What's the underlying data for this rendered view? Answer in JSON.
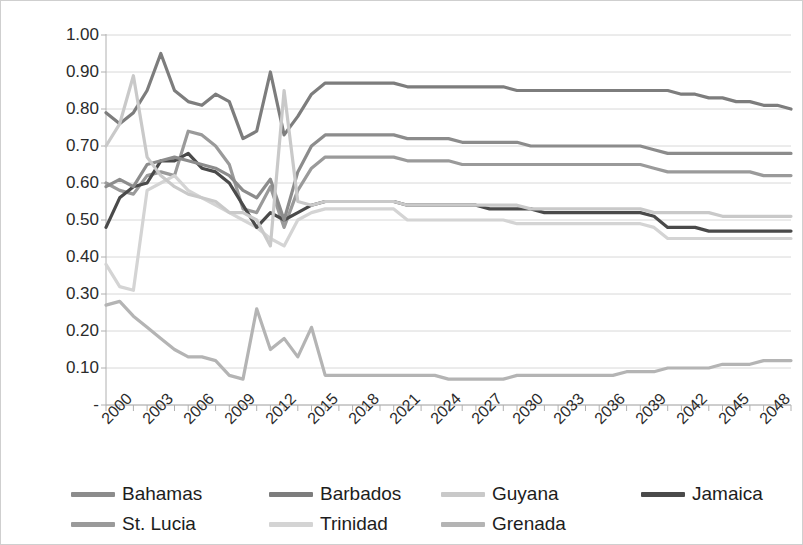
{
  "axes": {
    "ylabel": "Index",
    "yticks": [
      "1.00",
      "0.90",
      "0.80",
      "0.70",
      "0.60",
      "0.50",
      "0.40",
      "0.30",
      "0.20",
      "0.10",
      "-"
    ],
    "xticks": [
      "2000",
      "2003",
      "2006",
      "2009",
      "2012",
      "2015",
      "2018",
      "2021",
      "2024",
      "2027",
      "2030",
      "2033",
      "2036",
      "2039",
      "2042",
      "2045",
      "2048"
    ]
  },
  "legend": {
    "items": [
      {
        "label": "Bahamas",
        "color": "#8c8c8c"
      },
      {
        "label": "Barbados",
        "color": "#7d7d7d"
      },
      {
        "label": "Guyana",
        "color": "#c9c9c9"
      },
      {
        "label": "Jamaica",
        "color": "#4a4a4a"
      },
      {
        "label": "St. Lucia",
        "color": "#9a9a9a"
      },
      {
        "label": "Trinidad",
        "color": "#d4d4d4"
      },
      {
        "label": "Grenada",
        "color": "#b4b4b4"
      }
    ]
  },
  "chart_data": {
    "type": "line",
    "title": "",
    "xlabel": "",
    "ylabel": "Index",
    "xlim": [
      2000,
      2050
    ],
    "ylim": [
      0,
      1.0
    ],
    "grid": true,
    "legend_position": "bottom",
    "x": [
      2000,
      2001,
      2002,
      2003,
      2004,
      2005,
      2006,
      2007,
      2008,
      2009,
      2010,
      2011,
      2012,
      2013,
      2014,
      2015,
      2016,
      2017,
      2018,
      2019,
      2020,
      2021,
      2022,
      2023,
      2024,
      2025,
      2026,
      2027,
      2028,
      2029,
      2030,
      2031,
      2032,
      2033,
      2034,
      2035,
      2036,
      2037,
      2038,
      2039,
      2040,
      2041,
      2042,
      2043,
      2044,
      2045,
      2046,
      2047,
      2048,
      2049,
      2050
    ],
    "series": [
      {
        "name": "Barbados",
        "color": "#7d7d7d",
        "values": [
          0.79,
          0.76,
          0.79,
          0.85,
          0.95,
          0.85,
          0.82,
          0.81,
          0.84,
          0.82,
          0.72,
          0.74,
          0.9,
          0.73,
          0.78,
          0.84,
          0.87,
          0.87,
          0.87,
          0.87,
          0.87,
          0.87,
          0.86,
          0.86,
          0.86,
          0.86,
          0.86,
          0.86,
          0.86,
          0.86,
          0.85,
          0.85,
          0.85,
          0.85,
          0.85,
          0.85,
          0.85,
          0.85,
          0.85,
          0.85,
          0.85,
          0.85,
          0.84,
          0.84,
          0.83,
          0.83,
          0.82,
          0.82,
          0.81,
          0.81,
          0.8
        ]
      },
      {
        "name": "Bahamas",
        "color": "#8c8c8c",
        "values": [
          0.59,
          0.61,
          0.59,
          0.65,
          0.66,
          0.67,
          0.66,
          0.65,
          0.64,
          0.62,
          0.58,
          0.56,
          0.61,
          0.5,
          0.63,
          0.7,
          0.73,
          0.73,
          0.73,
          0.73,
          0.73,
          0.73,
          0.72,
          0.72,
          0.72,
          0.72,
          0.71,
          0.71,
          0.71,
          0.71,
          0.71,
          0.7,
          0.7,
          0.7,
          0.7,
          0.7,
          0.7,
          0.7,
          0.7,
          0.7,
          0.69,
          0.68,
          0.68,
          0.68,
          0.68,
          0.68,
          0.68,
          0.68,
          0.68,
          0.68,
          0.68
        ]
      },
      {
        "name": "St. Lucia",
        "color": "#9a9a9a",
        "values": [
          0.6,
          0.58,
          0.57,
          0.62,
          0.63,
          0.62,
          0.74,
          0.73,
          0.7,
          0.65,
          0.53,
          0.52,
          0.59,
          0.48,
          0.58,
          0.64,
          0.67,
          0.67,
          0.67,
          0.67,
          0.67,
          0.67,
          0.66,
          0.66,
          0.66,
          0.66,
          0.65,
          0.65,
          0.65,
          0.65,
          0.65,
          0.65,
          0.65,
          0.65,
          0.65,
          0.65,
          0.65,
          0.65,
          0.65,
          0.65,
          0.64,
          0.63,
          0.63,
          0.63,
          0.63,
          0.63,
          0.63,
          0.63,
          0.62,
          0.62,
          0.62
        ]
      },
      {
        "name": "Guyana",
        "color": "#c9c9c9",
        "values": [
          0.7,
          0.76,
          0.89,
          0.67,
          0.62,
          0.59,
          0.57,
          0.56,
          0.55,
          0.52,
          0.52,
          0.5,
          0.43,
          0.85,
          0.55,
          0.54,
          0.55,
          0.55,
          0.55,
          0.55,
          0.55,
          0.55,
          0.54,
          0.54,
          0.54,
          0.54,
          0.54,
          0.54,
          0.54,
          0.54,
          0.54,
          0.53,
          0.53,
          0.53,
          0.53,
          0.53,
          0.53,
          0.53,
          0.53,
          0.53,
          0.52,
          0.52,
          0.52,
          0.52,
          0.52,
          0.51,
          0.51,
          0.51,
          0.51,
          0.51,
          0.51
        ]
      },
      {
        "name": "Jamaica",
        "color": "#4a4a4a",
        "values": [
          0.48,
          0.56,
          0.59,
          0.6,
          0.66,
          0.66,
          0.68,
          0.64,
          0.63,
          0.6,
          0.54,
          0.48,
          0.52,
          0.5,
          0.52,
          0.54,
          0.55,
          0.55,
          0.55,
          0.55,
          0.55,
          0.55,
          0.54,
          0.54,
          0.54,
          0.54,
          0.54,
          0.54,
          0.53,
          0.53,
          0.53,
          0.53,
          0.52,
          0.52,
          0.52,
          0.52,
          0.52,
          0.52,
          0.52,
          0.52,
          0.51,
          0.48,
          0.48,
          0.48,
          0.47,
          0.47,
          0.47,
          0.47,
          0.47,
          0.47,
          0.47
        ]
      },
      {
        "name": "Trinidad",
        "color": "#d4d4d4",
        "values": [
          0.38,
          0.32,
          0.31,
          0.58,
          0.6,
          0.62,
          0.58,
          0.56,
          0.54,
          0.52,
          0.5,
          0.48,
          0.45,
          0.43,
          0.5,
          0.52,
          0.53,
          0.53,
          0.53,
          0.53,
          0.53,
          0.53,
          0.5,
          0.5,
          0.5,
          0.5,
          0.5,
          0.5,
          0.5,
          0.5,
          0.49,
          0.49,
          0.49,
          0.49,
          0.49,
          0.49,
          0.49,
          0.49,
          0.49,
          0.49,
          0.48,
          0.45,
          0.45,
          0.45,
          0.45,
          0.45,
          0.45,
          0.45,
          0.45,
          0.45,
          0.45
        ]
      },
      {
        "name": "Grenada",
        "color": "#b4b4b4",
        "values": [
          0.27,
          0.28,
          0.24,
          0.21,
          0.18,
          0.15,
          0.13,
          0.13,
          0.12,
          0.08,
          0.07,
          0.26,
          0.15,
          0.18,
          0.13,
          0.21,
          0.08,
          0.08,
          0.08,
          0.08,
          0.08,
          0.08,
          0.08,
          0.08,
          0.08,
          0.07,
          0.07,
          0.07,
          0.07,
          0.07,
          0.08,
          0.08,
          0.08,
          0.08,
          0.08,
          0.08,
          0.08,
          0.08,
          0.09,
          0.09,
          0.09,
          0.1,
          0.1,
          0.1,
          0.1,
          0.11,
          0.11,
          0.11,
          0.12,
          0.12,
          0.12
        ]
      }
    ]
  }
}
